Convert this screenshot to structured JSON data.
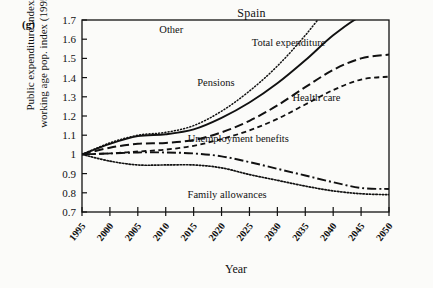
{
  "figure": {
    "panel_label": "(g)",
    "title": "Spain",
    "xlabel": "Year",
    "ylabel_line1": "Public expenditure index/",
    "ylabel_line2": "working age pop. index (1995=1)"
  },
  "chart_data": {
    "type": "line",
    "title": "Spain",
    "panel": "(g)",
    "xlabel": "Year",
    "ylabel": "Public expenditure index/ working age pop. index (1995=1)",
    "xlim": [
      1995,
      2050
    ],
    "ylim": [
      0.7,
      1.7
    ],
    "xticks": [
      1995,
      2000,
      2005,
      2010,
      2015,
      2020,
      2025,
      2030,
      2035,
      2040,
      2045,
      2050
    ],
    "yticks": [
      0.7,
      0.8,
      0.9,
      1,
      1.1,
      1.2,
      1.3,
      1.4,
      1.5,
      1.6,
      1.7
    ],
    "xtick_labels": [
      "1995",
      "2000",
      "2005",
      "2010",
      "2015",
      "2020",
      "2025",
      "2030",
      "2035",
      "2040",
      "2045",
      "2050"
    ],
    "ytick_labels": [
      "0.7",
      "0.8",
      "0.9",
      "1",
      "1.1",
      "1.2",
      "1.3",
      "1.4",
      "1.5",
      "1.6",
      "1.7"
    ],
    "grid": false,
    "legend_position": "inline-annotations",
    "x": [
      1995,
      2000,
      2005,
      2010,
      2015,
      2020,
      2025,
      2030,
      2035,
      2040,
      2045,
      2050
    ],
    "series": [
      {
        "name": "Total expenditure",
        "style": "solid",
        "label_x": 2032,
        "label_y": 1.565,
        "values": [
          1.0,
          1.055,
          1.095,
          1.105,
          1.13,
          1.19,
          1.27,
          1.37,
          1.49,
          1.62,
          1.72,
          1.76
        ],
        "clipped_at_top": true,
        "exit_year": 2036
      },
      {
        "name": "Other",
        "style": "fine-dotted",
        "label_x": 2011,
        "label_y": 1.63,
        "values": [
          1.0,
          1.06,
          1.1,
          1.115,
          1.15,
          1.225,
          1.33,
          1.46,
          1.62,
          1.8,
          1.95,
          2.05
        ],
        "clipped_at_top": true,
        "exit_year": 2028
      },
      {
        "name": "Pensions",
        "style": "long-dash",
        "label_x": 2019,
        "label_y": 1.355,
        "values": [
          1.0,
          1.035,
          1.055,
          1.06,
          1.075,
          1.115,
          1.175,
          1.255,
          1.35,
          1.44,
          1.5,
          1.52
        ]
      },
      {
        "name": "Health care",
        "style": "short-dash",
        "label_x": 2037,
        "label_y": 1.28,
        "values": [
          1.0,
          1.005,
          1.015,
          1.025,
          1.045,
          1.08,
          1.125,
          1.185,
          1.26,
          1.335,
          1.39,
          1.405
        ]
      },
      {
        "name": "Unemployment benefits",
        "style": "dash-dot",
        "label_x": 2023,
        "label_y": 1.065,
        "values": [
          1.0,
          1.005,
          1.01,
          1.01,
          1.005,
          0.99,
          0.96,
          0.925,
          0.89,
          0.855,
          0.825,
          0.82
        ]
      },
      {
        "name": "Family allowances",
        "style": "dotted",
        "label_x": 2021,
        "label_y": 0.775,
        "values": [
          1.0,
          0.965,
          0.945,
          0.945,
          0.945,
          0.93,
          0.895,
          0.865,
          0.835,
          0.81,
          0.795,
          0.79
        ]
      }
    ]
  }
}
